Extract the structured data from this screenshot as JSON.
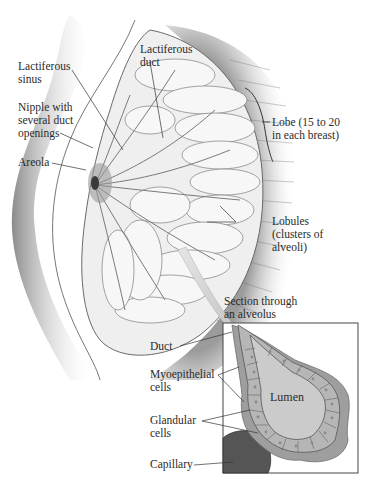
{
  "diagram": {
    "labels": {
      "lactiferous_sinus": [
        "Lactiferous",
        "sinus"
      ],
      "lactiferous_duct": [
        "Lactiferous",
        "duct"
      ],
      "nipple": [
        "Nipple with",
        "several duct",
        "openings"
      ],
      "areola": [
        "Areola"
      ],
      "lobe": [
        "Lobe (15 to 20",
        "in each breast)"
      ],
      "lobules": [
        "Lobules",
        "(clusters of",
        "alveoli)"
      ],
      "section_title": [
        "Section through",
        "an alveolus"
      ],
      "duct": [
        "Duct"
      ],
      "myoepithelial": [
        "Myoepithelial",
        "cells"
      ],
      "lumen": [
        "Lumen"
      ],
      "glandular": [
        "Glandular",
        "cells"
      ],
      "capillary": [
        "Capillary"
      ]
    },
    "colors": {
      "skin_shadow": "#8a8a8a",
      "tissue": "#e6e6e6",
      "alveolus_outer": "#9a9a9a",
      "cells": "#b4b4b4",
      "lumen": "#c8c8c8",
      "capillary": "#555555",
      "arrow": "#c9c9c9"
    }
  }
}
